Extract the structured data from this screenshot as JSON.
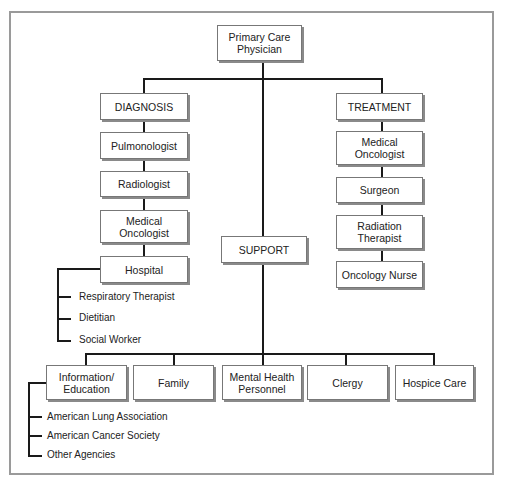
{
  "diagram": {
    "root": "Primary Care\nPhysician",
    "diagnosis": {
      "label": "DIAGNOSIS",
      "items": [
        "Pulmonologist",
        "Radiologist",
        "Medical Oncologist",
        "Hospital"
      ],
      "hospital_subitems": [
        "Respiratory Therapist",
        "Dietitian",
        "Social Worker"
      ]
    },
    "treatment": {
      "label": "TREATMENT",
      "items": [
        "Medical Oncologist",
        "Surgeon",
        "Radiation Therapist",
        "Oncology Nurse"
      ]
    },
    "support": {
      "label": "SUPPORT",
      "items": [
        "Information/ Education",
        "Family",
        "Mental Health Personnel",
        "Clergy",
        "Hospice Care"
      ],
      "information_subitems": [
        "American Lung Association",
        "American Cancer Society",
        "Other Agencies"
      ]
    }
  }
}
